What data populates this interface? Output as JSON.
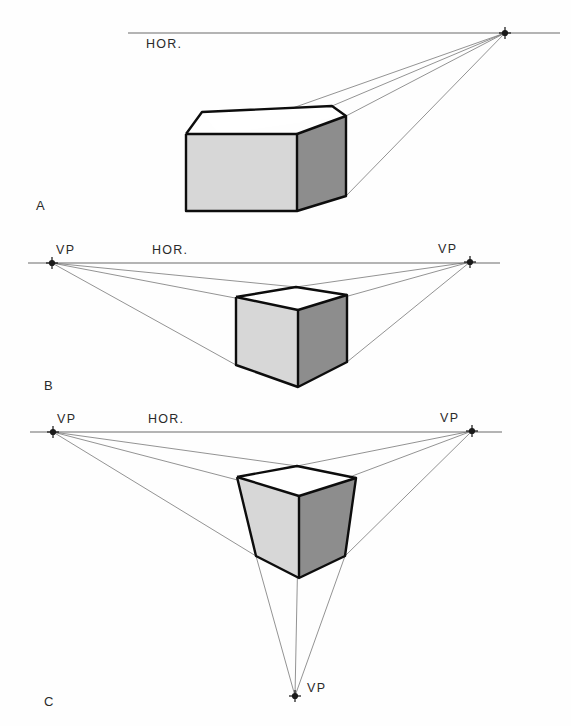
{
  "figure": {
    "background_color": "#fefefe",
    "colors": {
      "top_face": "#ffffff",
      "left_face": "#d7d7d7",
      "right_face": "#8d8d8d",
      "edge": "#0d0d0d",
      "ray": "#777777",
      "horizon": "#6a6a6a",
      "text": "#2a2a2a"
    }
  },
  "panels": [
    {
      "id": "A",
      "panel_label": "A",
      "panel_label_pos": {
        "x": 36,
        "y": 210
      },
      "perspective_type": "one-point",
      "horizon": {
        "label": "HOR.",
        "label_pos": {
          "x": 146,
          "y": 48
        },
        "y": 33,
        "x1": 128,
        "x2": 560
      },
      "vanishing_points": [
        {
          "name": "vp-right",
          "label": "",
          "x": 505,
          "y": 33
        }
      ],
      "box": {
        "top_face": "202,112 332,106 346,116 219,134",
        "left_face": "186,134 297,134 297,211 186,211",
        "right_face": "297,134 346,116 346,196 297,211",
        "outline": "186,134 202,112 332,106 346,116 346,196 297,211 186,211 186,134",
        "inner_edges": [
          "297,134 297,211",
          "186,134 297,134",
          "297,134 346,116"
        ]
      },
      "rays": [
        "219,134 505,33",
        "332,106 505,33",
        "346,116 505,33",
        "346,196 505,33"
      ]
    },
    {
      "id": "B",
      "panel_label": "B",
      "panel_label_pos": {
        "x": 44,
        "y": 390
      },
      "perspective_type": "two-point",
      "horizon": {
        "label": "HOR.",
        "label_pos": {
          "x": 152,
          "y": 254
        },
        "y": 263,
        "x1": 28,
        "x2": 500
      },
      "vanishing_points": [
        {
          "name": "vp-left",
          "label": "VP",
          "x": 52,
          "y": 263,
          "label_pos": {
            "x": 56,
            "y": 254
          }
        },
        {
          "name": "vp-right",
          "label": "VP",
          "x": 470,
          "y": 262,
          "label_pos": {
            "x": 438,
            "y": 253
          }
        }
      ],
      "box": {
        "top_face": "236,297 296,287 347,295 298,310",
        "left_face": "236,297 298,310 298,387 236,365",
        "right_face": "298,310 347,295 347,362 298,387",
        "outline": "236,297 296,287 347,295 347,362 298,387 236,365 236,297",
        "inner_edges": [
          "298,310 298,387",
          "236,297 298,310",
          "298,310 347,295"
        ]
      },
      "rays": [
        "52,263 296,287",
        "52,263 298,310",
        "52,263 236,365",
        "470,262 296,287",
        "470,262 298,310",
        "470,262 347,362"
      ]
    },
    {
      "id": "C",
      "panel_label": "C",
      "panel_label_pos": {
        "x": 44,
        "y": 706
      },
      "perspective_type": "three-point",
      "horizon": {
        "label": "HOR.",
        "label_pos": {
          "x": 148,
          "y": 423
        },
        "y": 432,
        "x1": 30,
        "x2": 502
      },
      "vanishing_points": [
        {
          "name": "vp-left",
          "label": "VP",
          "x": 53,
          "y": 432,
          "label_pos": {
            "x": 57,
            "y": 423
          }
        },
        {
          "name": "vp-right",
          "label": "VP",
          "x": 472,
          "y": 431,
          "label_pos": {
            "x": 440,
            "y": 422
          }
        },
        {
          "name": "vp-bottom",
          "label": "VP",
          "x": 295,
          "y": 696,
          "label_pos": {
            "x": 307,
            "y": 692
          }
        }
      ],
      "box": {
        "top_face": "237,477 297,466 356,478 299,496",
        "left_face": "237,477 299,496 299,578 256,556",
        "right_face": "299,496 356,478 345,556 299,578",
        "outline": "237,477 297,466 356,478 345,556 299,578 256,556 237,477",
        "inner_edges": [
          "299,496 299,578",
          "237,477 299,496",
          "299,496 356,478"
        ]
      },
      "rays": [
        "53,432 297,466",
        "53,432 299,496",
        "53,432 256,556",
        "472,431 297,466",
        "472,431 299,496",
        "472,431 345,556",
        "295,696 256,556",
        "295,696 299,496",
        "295,696 345,556"
      ]
    }
  ]
}
